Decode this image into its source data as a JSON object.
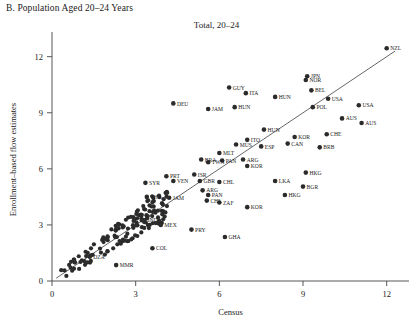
{
  "panel": {
    "label": "B. Population Aged 20–24 Years"
  },
  "chart_data": {
    "type": "scatter",
    "title": "Total, 20–24",
    "xlabel": "Census",
    "ylabel": "Enrollment–based flow estimates",
    "xlim": [
      0,
      12.8
    ],
    "ylim": [
      0,
      13.0
    ],
    "xticks": [
      0,
      3,
      6,
      9,
      12
    ],
    "yticks": [
      0,
      3,
      6,
      9,
      12
    ],
    "grid": false,
    "legend": "none",
    "reference_line": {
      "type": "diagonal",
      "slope": 1,
      "intercept": 0,
      "note": "45-degree line"
    },
    "points": [
      {
        "label": "NZL",
        "x": 12.0,
        "y": 12.45
      },
      {
        "label": "JPN",
        "x": 9.15,
        "y": 10.95
      },
      {
        "label": "NOR",
        "x": 9.1,
        "y": 10.75
      },
      {
        "label": "BEL",
        "x": 9.3,
        "y": 10.2
      },
      {
        "label": "HUN",
        "x": 8.0,
        "y": 9.85
      },
      {
        "label": "USA",
        "x": 9.9,
        "y": 9.75
      },
      {
        "label": "GUY",
        "x": 6.35,
        "y": 10.35
      },
      {
        "label": "ITA",
        "x": 6.95,
        "y": 10.05
      },
      {
        "label": "HUN",
        "x": 6.55,
        "y": 9.3
      },
      {
        "label": "POL",
        "x": 9.35,
        "y": 9.3
      },
      {
        "label": "USA",
        "x": 11.0,
        "y": 9.4
      },
      {
        "label": "DEU",
        "x": 4.35,
        "y": 9.5
      },
      {
        "label": "JAM",
        "x": 5.6,
        "y": 9.2
      },
      {
        "label": "AUS",
        "x": 10.4,
        "y": 8.7
      },
      {
        "label": "AUS",
        "x": 11.1,
        "y": 8.45
      },
      {
        "label": "CHE",
        "x": 9.85,
        "y": 7.85
      },
      {
        "label": "HUN",
        "x": 7.6,
        "y": 8.1
      },
      {
        "label": "ITO",
        "x": 7.0,
        "y": 7.55
      },
      {
        "label": "KOR",
        "x": 8.7,
        "y": 7.7
      },
      {
        "label": "CAN",
        "x": 8.45,
        "y": 7.35
      },
      {
        "label": "BRB",
        "x": 9.6,
        "y": 7.15
      },
      {
        "label": "ESP",
        "x": 7.5,
        "y": 7.2
      },
      {
        "label": "MUS",
        "x": 6.6,
        "y": 7.3
      },
      {
        "label": "MLT",
        "x": 6.0,
        "y": 6.85
      },
      {
        "label": "PAN",
        "x": 6.1,
        "y": 6.45
      },
      {
        "label": "ARG",
        "x": 6.85,
        "y": 6.5
      },
      {
        "label": "TWN",
        "x": 5.6,
        "y": 6.35
      },
      {
        "label": "BRA",
        "x": 5.35,
        "y": 6.5
      },
      {
        "label": "KOR",
        "x": 7.0,
        "y": 6.15
      },
      {
        "label": "PRT",
        "x": 4.1,
        "y": 5.6
      },
      {
        "label": "ISR",
        "x": 5.1,
        "y": 5.7
      },
      {
        "label": "VEN",
        "x": 4.35,
        "y": 5.35
      },
      {
        "label": "GBR",
        "x": 5.3,
        "y": 5.35
      },
      {
        "label": "CHL",
        "x": 6.0,
        "y": 5.3
      },
      {
        "label": "SYR",
        "x": 3.35,
        "y": 5.25
      },
      {
        "label": "LKA",
        "x": 8.0,
        "y": 5.35
      },
      {
        "label": "HKG",
        "x": 9.1,
        "y": 5.8
      },
      {
        "label": "BGR",
        "x": 9.0,
        "y": 5.05
      },
      {
        "label": "HKG",
        "x": 8.35,
        "y": 4.6
      },
      {
        "label": "THA",
        "x": 3.4,
        "y": 4.5
      },
      {
        "label": "JAM",
        "x": 4.2,
        "y": 4.45
      },
      {
        "label": "ARG",
        "x": 5.4,
        "y": 4.85
      },
      {
        "label": "PAN",
        "x": 5.6,
        "y": 4.6
      },
      {
        "label": "CHL",
        "x": 5.55,
        "y": 4.3
      },
      {
        "label": "ZAF",
        "x": 6.0,
        "y": 4.2
      },
      {
        "label": "KOR",
        "x": 7.0,
        "y": 3.95
      },
      {
        "label": "IND",
        "x": 3.3,
        "y": 3.25
      },
      {
        "label": "MEX",
        "x": 3.9,
        "y": 3.0
      },
      {
        "label": "PRY",
        "x": 5.0,
        "y": 2.75
      },
      {
        "label": "GHA",
        "x": 6.2,
        "y": 2.35
      },
      {
        "label": "COL",
        "x": 3.6,
        "y": 1.75
      },
      {
        "label": "DZA",
        "x": 1.35,
        "y": 1.3
      },
      {
        "label": "MMR",
        "x": 2.3,
        "y": 0.85
      }
    ],
    "unlabeled_cloud_note": "dense cluster of additional country points along the 45-degree line between 0 and 4"
  }
}
